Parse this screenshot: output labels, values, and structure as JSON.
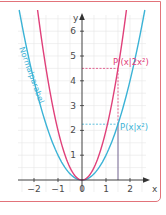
{
  "chart_data": {
    "type": "line",
    "title": "",
    "xlabel": "x",
    "ylabel": "y",
    "xlim": [
      -2.5,
      2.5
    ],
    "ylim": [
      0,
      6.5
    ],
    "grid": true,
    "grid_step": 0.5,
    "x_ticks": [
      -2,
      -1,
      0,
      1,
      2
    ],
    "x_tick_labels": [
      "−2",
      "−1",
      "0",
      "1",
      "2"
    ],
    "y_ticks": [
      1,
      2,
      3,
      4,
      5,
      6
    ],
    "y_tick_labels": [
      "1",
      "2",
      "3",
      "4",
      "5",
      "6"
    ],
    "series": [
      {
        "name": "Normalparabel",
        "formula": "y = x^2",
        "coefficient": 1,
        "color": "#3bb3d6",
        "curve_label": "Normalparabel"
      },
      {
        "name": "y = 2x^2",
        "formula": "y = 2x^2",
        "coefficient": 2,
        "color": "#e0407a"
      }
    ],
    "annotations": [
      {
        "label": "P(x|x²)",
        "x": 1.5,
        "y": 2.25,
        "color": "#3bb3d6"
      },
      {
        "label": "P'(x|2x²)",
        "x": 1.5,
        "y": 4.5,
        "color": "#e0407a"
      }
    ],
    "colors": {
      "frame": "#e2737a",
      "grid": "#e6e6e6",
      "axis": "#333333",
      "vertical_marker": "#6a5a8a"
    }
  }
}
